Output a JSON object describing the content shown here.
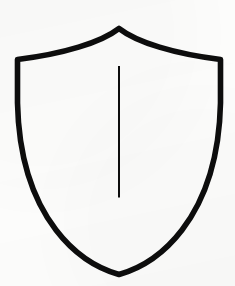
{
  "canvas": {
    "width": 235,
    "height": 286,
    "background_color": "#fdfdfc",
    "ink_color": "#0d0d0d"
  },
  "figure": {
    "name": "shield",
    "title": "Shield outline with vertical center line",
    "style": "line-art outline, hand-drawn / scanned, no fill",
    "stroke_color": "#0d0d0d",
    "fill_color": "none",
    "outline_stroke_width": 5.6,
    "divider_stroke_width": 2.0,
    "outline_path": "M 119.0 28.5 C 101.0 42.5 63.0 54.0 17.5 59.5 L 17.5 103.0 C 18.5 150.0 30.0 196.0 56.0 230.0 C 74.0 253.5 96.0 268.0 119.0 274.5 C 142.0 268.0 164.0 253.5 182.0 230.0 C 208.0 196.0 219.5 150.0 220.5 103.0 L 220.5 59.5 C 175.0 54.0 137.0 42.5 119.0 28.5 Z",
    "divider_line": {
      "name": "center-divider-line",
      "x1": 119.0,
      "y1": 66.0,
      "x2": 119.0,
      "y2": 197.5
    },
    "key_points": {
      "top_peak": [
        119,
        28
      ],
      "left_shoulder": [
        17,
        60
      ],
      "right_shoulder": [
        219,
        60
      ],
      "bottom_tip": [
        119,
        274
      ]
    }
  }
}
